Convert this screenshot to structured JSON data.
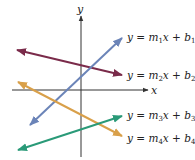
{
  "diagram": {
    "axes": {
      "x_label": "x",
      "y_label": "y",
      "color": "#333333"
    },
    "lines": [
      {
        "id": "line-1",
        "color": "#6b84b8",
        "label_y": "y",
        "label_eq": " = ",
        "label_m": "m",
        "label_m_sub": "1",
        "label_x": "x",
        "label_plus": " + ",
        "label_b": "b",
        "label_b_sub": "1"
      },
      {
        "id": "line-2",
        "color": "#7a2b4a",
        "label_y": "y",
        "label_eq": " = ",
        "label_m": "m",
        "label_m_sub": "2",
        "label_x": "x",
        "label_plus": " + ",
        "label_b": "b",
        "label_b_sub": "2"
      },
      {
        "id": "line-3",
        "color": "#2a9a78",
        "label_y": "y",
        "label_eq": " = ",
        "label_m": "m",
        "label_m_sub": "3",
        "label_x": "x",
        "label_plus": " + ",
        "label_b": "b",
        "label_b_sub": "3"
      },
      {
        "id": "line-4",
        "color": "#d9a04a",
        "label_y": "y",
        "label_eq": " = ",
        "label_m": "m",
        "label_m_sub": "4",
        "label_x": "x",
        "label_plus": " + ",
        "label_b": "b",
        "label_b_sub": "4"
      }
    ]
  }
}
